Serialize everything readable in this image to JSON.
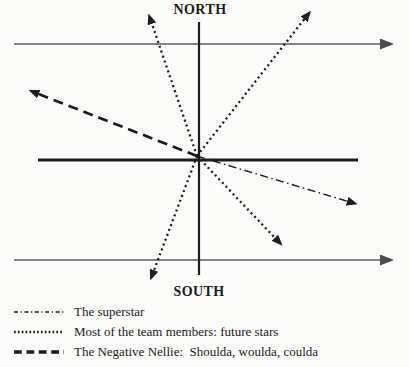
{
  "colors": {
    "ink": "#1d1d1d",
    "axis_gray": "#5e5e5e",
    "arrowhead_gray": "#4d4d4d",
    "background": "#fcfcfa"
  },
  "diagram": {
    "north_label": "NORTH",
    "south_label": "SOUTH",
    "center": {
      "x": 197,
      "y": 156
    },
    "static_lines": [
      {
        "name": "top-horizontal-arrow-line",
        "x1": 14,
        "y1": 44,
        "x2": 381,
        "y2": 44,
        "stroke": "gray",
        "width": 1.4,
        "arrow": true
      },
      {
        "name": "bottom-horizontal-arrow-line",
        "x1": 14,
        "y1": 260,
        "x2": 381,
        "y2": 260,
        "stroke": "gray",
        "width": 1.4,
        "arrow": true
      },
      {
        "name": "vertical-axis-line",
        "x1": 199,
        "y1": 22,
        "x2": 199,
        "y2": 275,
        "stroke": "ink",
        "width": 2.2,
        "arrow": false
      },
      {
        "name": "thick-horizontal-axis-line",
        "x1": 38,
        "y1": 160,
        "x2": 358,
        "y2": 160,
        "stroke": "ink",
        "width": 2.8,
        "arrow": false
      }
    ],
    "rays": [
      {
        "name": "future-star-ray-up-left",
        "style": "dotted",
        "x2": 151,
        "y2": 21
      },
      {
        "name": "future-star-ray-up-right",
        "style": "dotted",
        "x2": 306,
        "y2": 17
      },
      {
        "name": "negative-nellie-ray",
        "style": "dashed",
        "x2": 36,
        "y2": 93
      },
      {
        "name": "superstar-ray",
        "style": "dashdot",
        "x2": 350,
        "y2": 202
      },
      {
        "name": "future-star-ray-down-right",
        "style": "dotted",
        "x2": 277,
        "y2": 240
      },
      {
        "name": "future-star-ray-down-left",
        "style": "dotted",
        "x2": 153,
        "y2": 273
      }
    ]
  },
  "legend": {
    "items": [
      {
        "style": "dashdot",
        "label": "The superstar"
      },
      {
        "style": "dotted",
        "label": "Most of the team members: future stars"
      },
      {
        "style": "dashed",
        "label": "The Negative Nellie:  Shoulda, woulda, coulda"
      }
    ]
  }
}
